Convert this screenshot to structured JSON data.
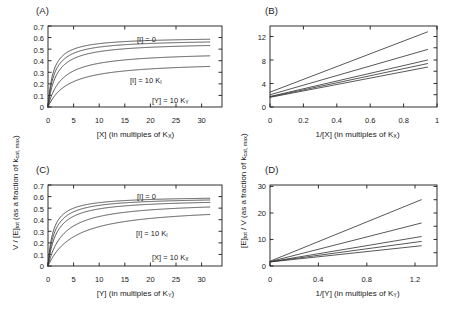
{
  "figure": {
    "background": "#ffffff",
    "curve_color": "#3a3a3a",
    "axis_color": "#1a1a1a"
  },
  "panels": {
    "A": {
      "label": "(A)",
      "xlabel": "[X] (in multiples of K",
      "xlabel_sub": "X",
      "xlabel_tail": ")",
      "ylabel_full": "V / [E]tot (as a fraction of kcat, max)",
      "annotations": [
        {
          "name": "inhibitor-zero",
          "text": "[I] = 0"
        },
        {
          "name": "inhibitor-ten-ki",
          "text": "[I] = 10 K",
          "sub": "I"
        },
        {
          "name": "fixed-y",
          "text": "[Y] = 10 K",
          "sub": "Y"
        }
      ],
      "xticks": [
        "0",
        "5",
        "10",
        "15",
        "20",
        "25",
        "30"
      ],
      "yticks": [
        "0",
        "0.1",
        "0.2",
        "0.3",
        "0.4",
        "0.5",
        "0.6",
        "0.7"
      ]
    },
    "B": {
      "label": "(B)",
      "xlabel": "1/[X] (in multiples of K",
      "xlabel_sub": "X",
      "xlabel_tail": ")",
      "ylabel_full": "[E]tot / V (as a fraction of kcat, max)",
      "xticks": [
        "0",
        "0.2",
        "0.4",
        "0.6",
        "0.8",
        "1"
      ],
      "yticks": [
        "0",
        "4",
        "8",
        "12"
      ]
    },
    "C": {
      "label": "(C)",
      "xlabel": "[Y] (in multiples of K",
      "xlabel_sub": "Y",
      "xlabel_tail": ")",
      "annotations": [
        {
          "name": "inhibitor-zero",
          "text": "[I] = 0"
        },
        {
          "name": "inhibitor-ten-ki",
          "text": "[I] = 10 K",
          "sub": "I"
        },
        {
          "name": "fixed-x",
          "text": "[X] = 10 K",
          "sub": "X"
        }
      ],
      "xticks": [
        "0",
        "5",
        "10",
        "15",
        "20",
        "25",
        "30"
      ],
      "yticks": [
        "0",
        "0.1",
        "0.2",
        "0.3",
        "0.4",
        "0.5",
        "0.6",
        "0.7"
      ]
    },
    "D": {
      "label": "(D)",
      "xlabel": "1/[Y] (in multiples of K",
      "xlabel_sub": "Y",
      "xlabel_tail": ")",
      "xticks": [
        "0",
        "0.4",
        "0.8",
        "1.2"
      ],
      "yticks": [
        "0",
        "10",
        "20",
        "30"
      ]
    }
  },
  "shared_labels": {
    "left_y_axis": {
      "prefix": "V / [E]",
      "sub1": "tot",
      "mid": " (as a fraction of k",
      "sub2": "cat, max",
      "tail": ")"
    },
    "right_y_axis": {
      "prefix": "[E]",
      "sub1": "tot",
      "mid": " / V (as a fraction of k",
      "sub2": "cat, max",
      "tail": ")"
    }
  },
  "chart_data": [
    {
      "id": "A",
      "type": "line",
      "title": "(A)",
      "xlabel": "[X] (in multiples of KX)",
      "ylabel": "V / [E]tot (as a fraction of kcat, max)",
      "xlim": [
        0,
        34
      ],
      "ylim": [
        0,
        0.7
      ],
      "xticks": [
        0,
        5,
        10,
        15,
        20,
        25,
        30
      ],
      "yticks": [
        0,
        0.1,
        0.2,
        0.3,
        0.4,
        0.5,
        0.6,
        0.7
      ],
      "grid": false,
      "legend": "none",
      "annotations": [
        "[I] = 0",
        "[I] = 10 KI",
        "[Y] = 10 KY"
      ],
      "model": "V/[E]tot = Vmax_eff * x / (Km_eff + x)",
      "series": [
        {
          "name": "[I] = 0",
          "vmax": 0.605,
          "km": 1.05,
          "x_end": 31.6,
          "y_end": 0.585
        },
        {
          "name": "[I] = 0.5 KI",
          "vmax": 0.585,
          "km": 1.3,
          "x_end": 31.6,
          "y_end": 0.562
        },
        {
          "name": "[I] = 1 KI",
          "vmax": 0.56,
          "km": 1.7,
          "x_end": 31.6,
          "y_end": 0.531
        },
        {
          "name": "[I] = 3 KI",
          "vmax": 0.48,
          "km": 2.7,
          "x_end": 31.6,
          "y_end": 0.442
        },
        {
          "name": "[I] = 10 KI",
          "vmax": 0.395,
          "km": 4.0,
          "x_end": 31.6,
          "y_end": 0.351
        }
      ]
    },
    {
      "id": "B",
      "type": "line",
      "title": "(B)",
      "xlabel": "1/[X] (in multiples of KX)",
      "ylabel": "[E]tot / V (as a fraction of kcat, max)",
      "xlim": [
        0,
        1.06
      ],
      "ylim": [
        0,
        13.8
      ],
      "xticks": [
        0,
        0.2,
        0.4,
        0.6,
        0.8,
        1
      ],
      "yticks": [
        0,
        4,
        8,
        12
      ],
      "grid": false,
      "legend": "none",
      "model": "[E]tot/V = intercept + slope * (1/x)",
      "series": [
        {
          "name": "[I] = 0",
          "intercept": 1.65,
          "slope": 5.15,
          "x_end": 1.0,
          "y_end": 6.8
        },
        {
          "name": "[I] = 0.5 KI",
          "intercept": 1.71,
          "slope": 5.69,
          "x_end": 1.0,
          "y_end": 7.4
        },
        {
          "name": "[I] = 1 KI",
          "intercept": 1.79,
          "slope": 6.21,
          "x_end": 1.0,
          "y_end": 8.0
        },
        {
          "name": "[I] = 3 KI",
          "intercept": 2.08,
          "slope": 7.72,
          "x_end": 1.0,
          "y_end": 9.8
        },
        {
          "name": "[I] = 10 KI",
          "intercept": 2.53,
          "slope": 10.27,
          "x_end": 1.0,
          "y_end": 12.8
        }
      ]
    },
    {
      "id": "C",
      "type": "line",
      "title": "(C)",
      "xlabel": "[Y] (in multiples of KY)",
      "ylabel": "V / [E]tot (as a fraction of kcat, max)",
      "xlim": [
        0,
        34
      ],
      "ylim": [
        0,
        0.7
      ],
      "xticks": [
        0,
        5,
        10,
        15,
        20,
        25,
        30
      ],
      "yticks": [
        0,
        0.1,
        0.2,
        0.3,
        0.4,
        0.5,
        0.6,
        0.7
      ],
      "grid": false,
      "legend": "none",
      "annotations": [
        "[I] = 0",
        "[I] = 10 KI",
        "[X] = 10 KX"
      ],
      "model": "V/[E]tot = Vmax_eff * y / (Km_eff + y)",
      "series": [
        {
          "name": "[I] = 0",
          "vmax": 0.605,
          "km": 1.05,
          "x_end": 31.6,
          "y_end": 0.585
        },
        {
          "name": "[I] = 0.5 KI",
          "vmax": 0.595,
          "km": 1.35,
          "x_end": 31.6,
          "y_end": 0.57
        },
        {
          "name": "[I] = 1 KI",
          "vmax": 0.58,
          "km": 1.75,
          "x_end": 31.6,
          "y_end": 0.549
        },
        {
          "name": "[I] = 3 KI",
          "vmax": 0.56,
          "km": 3.1,
          "x_end": 31.6,
          "y_end": 0.51
        },
        {
          "name": "[I] = 10 KI",
          "vmax": 0.52,
          "km": 5.3,
          "x_end": 31.6,
          "y_end": 0.445
        }
      ]
    },
    {
      "id": "D",
      "type": "line",
      "title": "(D)",
      "xlabel": "1/[Y] (in multiples of KY)",
      "ylabel": "[E]tot / V (as a fraction of kcat, max)",
      "xlim": [
        0,
        1.38
      ],
      "ylim": [
        0,
        33
      ],
      "xticks": [
        0,
        0.4,
        0.8,
        1.2
      ],
      "yticks": [
        0,
        10,
        20,
        30
      ],
      "grid": false,
      "legend": "none",
      "model": "[E]tot/V = intercept + slope * (1/y)",
      "series": [
        {
          "name": "[I] = 0",
          "intercept": 1.65,
          "slope": 5.28,
          "x_end": 1.25,
          "y_end": 8.25
        },
        {
          "name": "[I] = 0.5 KI",
          "intercept": 1.68,
          "slope": 6.66,
          "x_end": 1.25,
          "y_end": 10.0
        },
        {
          "name": "[I] = 1 KI",
          "intercept": 1.72,
          "slope": 8.22,
          "x_end": 1.25,
          "y_end": 12.0
        },
        {
          "name": "[I] = 3 KI",
          "intercept": 1.79,
          "slope": 12.57,
          "x_end": 1.25,
          "y_end": 17.5
        },
        {
          "name": "[I] = 10 KI",
          "intercept": 1.92,
          "slope": 20.06,
          "x_end": 1.25,
          "y_end": 27.0
        }
      ]
    }
  ]
}
